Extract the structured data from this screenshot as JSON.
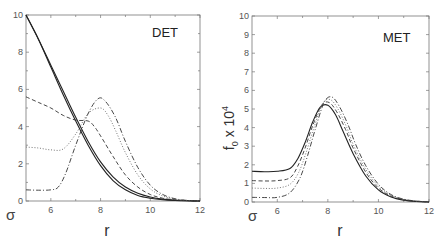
{
  "figure": {
    "background": "#ffffff",
    "line_color": "#333333"
  },
  "chart_data": [
    {
      "type": "line",
      "panel_label": "DET",
      "title": "",
      "xlabel": "r",
      "ylabel": "",
      "corner_label": "σ",
      "xlim": [
        5,
        12
      ],
      "ylim": [
        0,
        10
      ],
      "x_ticks": [
        6,
        8,
        10,
        12
      ],
      "x_tick_labels": [
        "6",
        "8",
        "10",
        "12"
      ],
      "y_ticks": [
        0,
        2,
        4,
        6,
        8,
        10
      ],
      "y_tick_labels": [
        "0",
        "2",
        "4",
        "6",
        "8",
        "10"
      ],
      "grid": false,
      "legend": null,
      "series": [
        {
          "name": "solid-1",
          "style": "solid",
          "color": "#222222",
          "x": [
            5.0,
            5.5,
            6.0,
            6.5,
            7.0,
            7.5,
            8.0,
            8.5,
            9.0,
            9.5,
            10.0,
            10.5,
            11.0,
            11.5,
            12.0
          ],
          "y": [
            10.0,
            8.7,
            7.2,
            5.7,
            4.3,
            3.0,
            1.9,
            1.1,
            0.6,
            0.3,
            0.15,
            0.07,
            0.03,
            0.01,
            0.0
          ]
        },
        {
          "name": "solid-2",
          "style": "solid",
          "color": "#222222",
          "x": [
            5.0,
            5.5,
            6.0,
            6.5,
            7.0,
            7.5,
            8.0,
            8.5,
            9.0,
            9.5,
            10.0,
            10.5,
            11.0,
            11.5,
            12.0
          ],
          "y": [
            10.0,
            8.7,
            7.3,
            5.9,
            4.5,
            3.2,
            2.1,
            1.3,
            0.75,
            0.42,
            0.22,
            0.1,
            0.04,
            0.01,
            0.0
          ]
        },
        {
          "name": "dashed",
          "style": "dashed",
          "color": "#333333",
          "x": [
            5.0,
            5.5,
            6.0,
            6.5,
            7.0,
            7.5,
            7.75,
            8.0,
            8.5,
            9.0,
            9.5,
            10.0,
            10.5,
            11.0,
            11.5,
            12.0
          ],
          "y": [
            5.6,
            5.3,
            5.0,
            4.6,
            4.35,
            4.3,
            4.0,
            3.5,
            2.4,
            1.4,
            0.75,
            0.35,
            0.15,
            0.06,
            0.02,
            0.0
          ]
        },
        {
          "name": "dotted",
          "style": "dotted",
          "color": "#666666",
          "x": [
            5.0,
            5.5,
            6.0,
            6.5,
            7.0,
            7.5,
            8.0,
            8.3,
            8.6,
            9.0,
            9.5,
            10.0,
            10.5,
            11.0,
            11.5,
            12.0
          ],
          "y": [
            2.9,
            2.85,
            2.75,
            2.8,
            3.6,
            4.7,
            5.0,
            4.6,
            3.8,
            2.6,
            1.4,
            0.65,
            0.27,
            0.1,
            0.03,
            0.0
          ]
        },
        {
          "name": "dash-dot",
          "style": "dashdot",
          "color": "#333333",
          "x": [
            5.0,
            5.5,
            6.0,
            6.3,
            6.6,
            7.0,
            7.5,
            7.9,
            8.2,
            8.6,
            9.0,
            9.5,
            10.0,
            10.5,
            11.0,
            11.5,
            12.0
          ],
          "y": [
            0.6,
            0.58,
            0.6,
            0.75,
            1.5,
            3.0,
            4.7,
            5.5,
            5.35,
            4.5,
            3.2,
            1.8,
            0.85,
            0.35,
            0.12,
            0.03,
            0.0
          ]
        }
      ]
    },
    {
      "type": "line",
      "panel_label": "MET",
      "title": "",
      "xlabel": "r",
      "ylabel": "f₀ x 10⁴",
      "ylabel_main": "f",
      "ylabel_sub": "0",
      "ylabel_mid": " x 10",
      "ylabel_sup": "4",
      "corner_label": "σ",
      "xlim": [
        5,
        12
      ],
      "ylim": [
        0,
        10
      ],
      "x_ticks": [
        6,
        8,
        10,
        12
      ],
      "x_tick_labels": [
        "6",
        "8",
        "10",
        "12"
      ],
      "y_ticks": [
        0,
        1,
        2,
        3,
        4,
        5,
        6,
        7,
        8,
        9,
        10
      ],
      "y_tick_labels": [
        "0",
        "1",
        "2",
        "3",
        "4",
        "5",
        "6",
        "7",
        "8",
        "9",
        "10"
      ],
      "grid": false,
      "legend": null,
      "series": [
        {
          "name": "solid",
          "style": "solid",
          "color": "#222222",
          "x": [
            5.0,
            5.5,
            6.0,
            6.5,
            6.8,
            7.1,
            7.4,
            7.7,
            8.0,
            8.3,
            8.6,
            9.0,
            9.5,
            10.0,
            10.5,
            11.0,
            11.5,
            12.0
          ],
          "y": [
            1.65,
            1.63,
            1.65,
            1.8,
            2.3,
            3.2,
            4.3,
            5.1,
            5.2,
            4.7,
            3.8,
            2.6,
            1.4,
            0.65,
            0.27,
            0.1,
            0.03,
            0.0
          ]
        },
        {
          "name": "dashed",
          "style": "dashed",
          "color": "#333333",
          "x": [
            5.0,
            5.5,
            6.0,
            6.5,
            6.8,
            7.1,
            7.4,
            7.75,
            8.05,
            8.35,
            8.7,
            9.0,
            9.5,
            10.0,
            10.5,
            11.0,
            11.5,
            12.0
          ],
          "y": [
            1.15,
            1.13,
            1.15,
            1.3,
            1.9,
            2.9,
            4.1,
            5.2,
            5.35,
            4.85,
            3.9,
            2.9,
            1.6,
            0.75,
            0.32,
            0.12,
            0.04,
            0.0
          ]
        },
        {
          "name": "dotted",
          "style": "dotted",
          "color": "#666666",
          "x": [
            5.0,
            5.5,
            6.0,
            6.5,
            6.85,
            7.15,
            7.45,
            7.8,
            8.1,
            8.4,
            8.75,
            9.0,
            9.5,
            10.0,
            10.5,
            11.0,
            11.5,
            12.0
          ],
          "y": [
            0.75,
            0.73,
            0.75,
            0.95,
            1.6,
            2.7,
            4.0,
            5.3,
            5.5,
            5.0,
            4.0,
            3.1,
            1.75,
            0.85,
            0.36,
            0.14,
            0.05,
            0.0
          ]
        },
        {
          "name": "dash-dot",
          "style": "dashdot",
          "color": "#333333",
          "x": [
            5.0,
            5.5,
            6.0,
            6.5,
            6.9,
            7.2,
            7.5,
            7.85,
            8.15,
            8.45,
            8.8,
            9.1,
            9.5,
            10.0,
            10.5,
            11.0,
            11.5,
            12.0
          ],
          "y": [
            0.25,
            0.24,
            0.25,
            0.5,
            1.3,
            2.5,
            3.9,
            5.35,
            5.65,
            5.15,
            4.15,
            3.1,
            1.95,
            0.95,
            0.4,
            0.15,
            0.05,
            0.0
          ]
        }
      ]
    }
  ],
  "panels": {
    "left": {
      "label": "DET",
      "corner": "σ",
      "xlabel": "r"
    },
    "right": {
      "label": "MET",
      "corner": "σ",
      "xlabel": "r",
      "ylabel_main": "f",
      "ylabel_sub": "0",
      "ylabel_mid": " x 10",
      "ylabel_sup": "4"
    }
  }
}
